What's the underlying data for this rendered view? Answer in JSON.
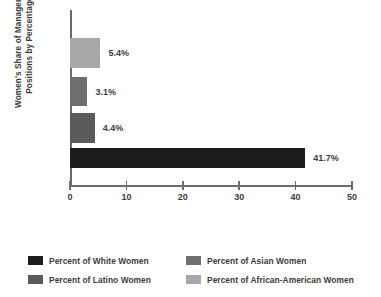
{
  "chart_data": {
    "type": "bar",
    "orientation": "horizontal",
    "title": "",
    "xlabel": "",
    "ylabel": "Women's Share of Management\nPositions by Percentage",
    "xlim": [
      0,
      50
    ],
    "xticks": [
      0,
      10,
      20,
      30,
      40,
      50
    ],
    "xtick_labels": [
      "0",
      "10",
      "20",
      "30",
      "40",
      "50"
    ],
    "grid": false,
    "legend_position": "bottom",
    "categories": [
      "Percent of African-American Women",
      "Percent of Asian Women",
      "Percent of Latino Women",
      "Percent of White Women"
    ],
    "values": [
      5.4,
      3.1,
      4.4,
      41.7
    ],
    "value_labels": [
      "5.4%",
      "3.1%",
      "4.4%",
      "41.7%"
    ],
    "colors": [
      "#a8a8a8",
      "#6e6e6e",
      "#5a5a5a",
      "#1c1c1c"
    ],
    "bars": [
      {
        "label": "Percent of African-American Women",
        "value": 5.4,
        "value_label": "5.4%",
        "color": "#a8a8a8",
        "top": 38,
        "height": 30
      },
      {
        "label": "Percent of Asian Women",
        "value": 3.1,
        "value_label": "3.1%",
        "color": "#6e6e6e",
        "top": 77,
        "height": 29
      },
      {
        "label": "Percent of Latino Women",
        "value": 4.4,
        "value_label": "4.4%",
        "color": "#5a5a5a",
        "top": 113,
        "height": 30
      },
      {
        "label": "Percent of White Women",
        "value": 41.7,
        "value_label": "41.7%",
        "color": "#1c1c1c",
        "top": 148,
        "height": 20
      }
    ]
  },
  "legend": {
    "entries": [
      {
        "label": "Percent of White Women",
        "color": "#1c1c1c"
      },
      {
        "label": "Percent of Asian Women",
        "color": "#6e6e6e"
      },
      {
        "label": "Percent of Latino Women",
        "color": "#5a5a5a"
      },
      {
        "label": "Percent of African-American Women",
        "color": "#a8a8a8"
      }
    ]
  },
  "axis": {
    "line_color": "#6b6b6b"
  }
}
